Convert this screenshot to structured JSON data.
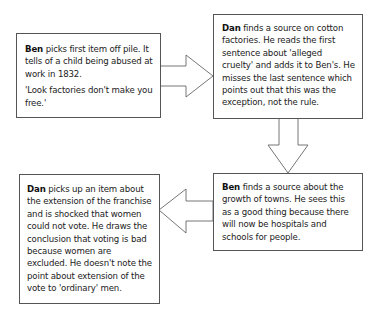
{
  "steps": [
    {
      "actor": "Ben",
      "text": " picks first item off pile. It tells of a child being abused at work in 1832.",
      "quote": "'Look factories don't make you free.'"
    },
    {
      "actor": "Dan",
      "text": " finds a source on cotton factories. He reads the first sentence about 'alleged cruelty' and adds it to Ben's. He misses the last sentence which points out that this was the exception, not the rule."
    },
    {
      "actor": "Ben",
      "text": " finds a source about the growth of towns. He sees this as a good thing because there will now be hospitals and schools for people."
    },
    {
      "actor": "Dan",
      "text": " picks up an item about the extension of the franchise and is shocked that women could not vote. He draws the conclusion that voting is bad because women are excluded. He doesn't note the point about extension of the vote to 'ordinary' men."
    }
  ],
  "flow": [
    {
      "from": 0,
      "to": 1,
      "direction": "right"
    },
    {
      "from": 1,
      "to": 2,
      "direction": "down"
    },
    {
      "from": 2,
      "to": 3,
      "direction": "left"
    }
  ]
}
